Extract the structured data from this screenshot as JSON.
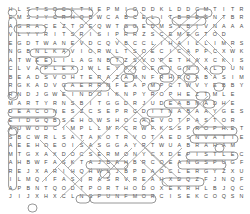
{
  "puzzle": {
    "type": "word-search",
    "columns": 27,
    "rows": 24,
    "letter_color": "#4a4a4a",
    "mark_color": "#8c8c8c",
    "background_color": "#ffffff",
    "grid": [
      "HLSTSOCLTNEPMIODDKLDDCMTITRE",
      "EMSJYCRHQBWCABCELITBRESNTBRV",
      "AGRACEZTOEQWTGGEDMSVBIVNAAA",
      "VLYYRITSRISIPRRZSCEMEGTOD",
      "EGDTWANEVDCQVBCCLIHAILLIMRS",
      "NGBNLKAVIORWLTSOECICAPPCXWK",
      "ATWEELILAGNBTZSVOPETHAXCKIS",
      "CLVAPLEXJWLEYTXOEAJGNIALDUN",
      "BEADSVOHTERAZAMNFRHRQABASIM",
      "RGKADVGAERRNFEAPMPCTWVYEBBY",
      "RNDJGWEINDOIKNPYROPHEZTMLE",
      "MARTYRNSBITGGDRJUDEABNADHE",
      "DEACONESZCSEPRCDITNABAAYGES",
      "EIDGQBSEHOWSHOCAEVOTPASTOR",
      "AUWODCIMPLLMPCRWFKSSPROPHET",
      "SBCWRLSATAKOTRVOTAEDSNVATIE",
      "AEEHOEOISASGGAYRTWUABRAHAM",
      "MTGXAXDOCSERMONYCXDEPISTLEC",
      "AHBWFASKTAJBAHBRCOEANGSPUGF",
      "REJXARIHQHWLJBPDAOCLERGYZXU",
      "ILMQIFASIRASRVREAHXDQZFJNQF",
      "APBNTQODTPORTHODOXEKRHLBJQC",
      "JIJXHXCLNSPUNFMORCISEKCOQSN"
    ],
    "found_words": [
      "HEAVEN",
      "GRACE",
      "SACRAMENT",
      "SAMARIA",
      "MARTYR",
      "DEACON",
      "PASTOR",
      "PROPHET",
      "SERMON",
      "ABRAHAM",
      "EPISTLE",
      "CLERGY",
      "ORTHODOX",
      "JUDE"
    ]
  }
}
